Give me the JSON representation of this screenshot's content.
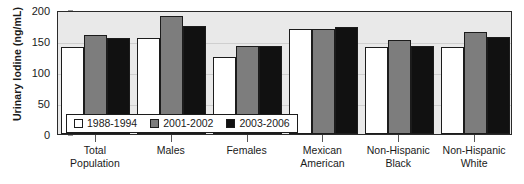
{
  "chart_data": {
    "type": "bar",
    "title": "",
    "subtitle": "",
    "xlabel": "",
    "ylabel": "Urinary Iodine (ng/mL)",
    "categories": [
      "Total Population",
      "Males",
      "Females",
      "Mexican American",
      "Non-Hispanic Black",
      "Non-Hispanic White"
    ],
    "category_lines": [
      [
        "Total",
        "Population"
      ],
      [
        "Males",
        ""
      ],
      [
        "Females",
        ""
      ],
      [
        "Mexican",
        "American"
      ],
      [
        "Non-Hispanic",
        "Black"
      ],
      [
        "Non-Hispanic",
        "White"
      ]
    ],
    "series": [
      {
        "name": "1988-1994",
        "color": "#ffffff",
        "values": [
          140,
          155,
          125,
          170,
          140,
          140
        ]
      },
      {
        "name": "2001-2002",
        "color": "#7d7d7d",
        "values": [
          160,
          190,
          142,
          170,
          152,
          164
        ]
      },
      {
        "name": "2003-2006",
        "color": "#111111",
        "values": [
          155,
          175,
          142,
          172,
          142,
          157
        ]
      }
    ],
    "ylim": [
      0,
      200
    ],
    "yticks": [
      0,
      50,
      100,
      150,
      200
    ],
    "ytick_labels": [
      "0",
      "50",
      "100",
      "150",
      "200"
    ],
    "grid": true,
    "grid_axis": "y",
    "legend_position": "inside-bottom-left",
    "legend_entries": [
      "1988-1994",
      "2001-2002",
      "2003-2006"
    ],
    "plot_background": "#e9e9e9",
    "frame_color": "#2b2b2b"
  }
}
